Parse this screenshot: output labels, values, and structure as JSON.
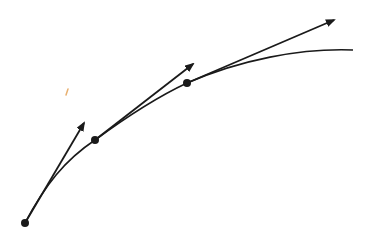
{
  "diagram": {
    "type": "curve-with-tangent-vectors",
    "colors": {
      "background": "#ffffff",
      "stroke": "#1a1a1a",
      "mark": "#e8b070"
    },
    "curve": {
      "path": "M25,223 C45,185 65,160 95,140 C125,118 155,98 187,83 C240,60 300,48 353,50"
    },
    "points": [
      {
        "id": "p0",
        "x": 25,
        "y": 223,
        "tangent_to": {
          "x": 84,
          "y": 123
        }
      },
      {
        "id": "p1",
        "x": 95,
        "y": 140,
        "tangent_to": {
          "x": 193,
          "y": 64
        }
      },
      {
        "id": "p2",
        "x": 187,
        "y": 83,
        "tangent_to": {
          "x": 334,
          "y": 20
        }
      }
    ],
    "stray_mark": {
      "x1": 66,
      "y1": 95,
      "x2": 68,
      "y2": 89
    }
  }
}
